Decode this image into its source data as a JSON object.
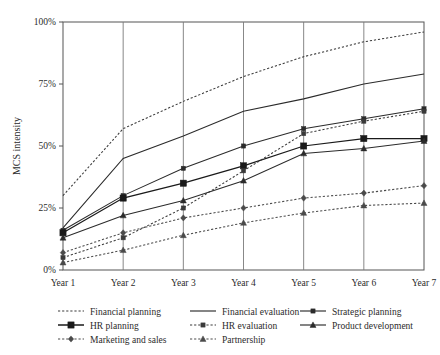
{
  "chart_data": {
    "type": "line",
    "title": "",
    "xlabel": "",
    "ylabel": "MCS intensity",
    "categories": [
      "Year 1",
      "Year 2",
      "Year 3",
      "Year 4",
      "Year 5",
      "Year 6",
      "Year 7"
    ],
    "ylim": [
      0,
      100
    ],
    "yticks": [
      0,
      25,
      50,
      75,
      100
    ],
    "ytick_labels": [
      "0%",
      "25%",
      "50%",
      "75%",
      "100%"
    ],
    "grid": "vertical",
    "legend_position": "bottom",
    "value_unit": "%",
    "series": [
      {
        "name": "Financial planning",
        "style": "dotted",
        "marker": "none",
        "color": "#3a3a3a",
        "values": [
          30,
          57,
          68,
          78,
          86,
          92,
          96
        ]
      },
      {
        "name": "Financial evaluation",
        "style": "solid",
        "marker": "none",
        "color": "#2b2b2b",
        "values": [
          17,
          45,
          54,
          64,
          69,
          75,
          79
        ]
      },
      {
        "name": "Strategic planning",
        "style": "solid",
        "marker": "square-small",
        "color": "#2b2b2b",
        "values": [
          16,
          30,
          41,
          50,
          57,
          61,
          65
        ]
      },
      {
        "name": "HR planning",
        "style": "solid",
        "marker": "square-large",
        "color": "#1a1a1a",
        "values": [
          15,
          29,
          35,
          42,
          50,
          53,
          53
        ]
      },
      {
        "name": "HR evaluation",
        "style": "dotted",
        "marker": "square-small",
        "color": "#3a3a3a",
        "values": [
          5,
          13,
          25,
          40,
          55,
          60,
          64
        ]
      },
      {
        "name": "Product development",
        "style": "solid",
        "marker": "triangle",
        "color": "#2b2b2b",
        "values": [
          13,
          22,
          28,
          36,
          47,
          49,
          52
        ]
      },
      {
        "name": "Marketing and sales",
        "style": "dotted",
        "marker": "diamond",
        "color": "#4a4a4a",
        "values": [
          7,
          15,
          21,
          25,
          29,
          31,
          34
        ]
      },
      {
        "name": "Partnership",
        "style": "dotted",
        "marker": "triangle",
        "color": "#4a4a4a",
        "values": [
          3,
          8,
          14,
          19,
          23,
          26,
          27
        ]
      }
    ]
  },
  "legend": {
    "rows": [
      [
        {
          "label": "Financial planning",
          "key": "financial-planning"
        },
        {
          "label": "Financial evaluation",
          "key": "financial-evaluation"
        },
        {
          "label": "Strategic planning",
          "key": "strategic-planning"
        }
      ],
      [
        {
          "label": "HR planning",
          "key": "hr-planning"
        },
        {
          "label": "HR evaluation",
          "key": "hr-evaluation"
        },
        {
          "label": "Product development",
          "key": "product-development"
        }
      ],
      [
        {
          "label": "Marketing and sales",
          "key": "marketing-and-sales"
        },
        {
          "label": "Partnership",
          "key": "partnership"
        }
      ]
    ]
  }
}
